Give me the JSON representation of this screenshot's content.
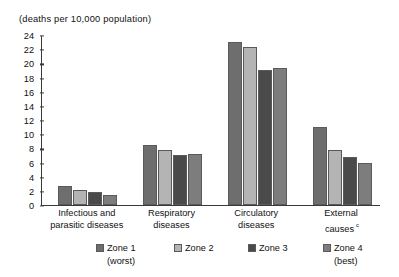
{
  "chart_data": {
    "type": "bar",
    "title": "(deaths per 10,000 population)",
    "subtitle": "",
    "xlabel": "",
    "ylabel": "",
    "ylim": [
      0,
      24
    ],
    "ytick_step": 2,
    "grid": false,
    "legend_position": "bottom",
    "categories": [
      "Infectious and parasitic diseases",
      "Respiratory diseases",
      "Circulatory diseases",
      "External causes"
    ],
    "category_lines": [
      [
        "Infectious and",
        "parasitic diseases"
      ],
      [
        "Respiratory",
        "diseases"
      ],
      [
        "Circulatory",
        "diseases"
      ],
      [
        "External",
        "causes"
      ]
    ],
    "category_footnotes": [
      "",
      "",
      "",
      "c"
    ],
    "ytick_labels": [
      "0",
      "2",
      "4",
      "6",
      "8",
      "10",
      "12",
      "14",
      "16",
      "18",
      "20",
      "22",
      "24"
    ],
    "series": [
      {
        "name": "Zone 1",
        "note": "(worst)",
        "color": "#6e6e6e",
        "values": [
          2.7,
          8.45,
          23.0,
          11.0
        ]
      },
      {
        "name": "Zone 2",
        "note": "",
        "color": "#b4b4b4",
        "values": [
          2.15,
          7.75,
          22.35,
          7.75
        ]
      },
      {
        "name": "Zone 3",
        "note": "",
        "color": "#4a4a4a",
        "values": [
          1.9,
          7.1,
          19.1,
          6.8
        ]
      },
      {
        "name": "Zone 4",
        "note": "(best)",
        "color": "#7d7d7d",
        "values": [
          1.45,
          7.2,
          19.4,
          6.0
        ]
      }
    ]
  },
  "legend": {
    "items": [
      {
        "label": "Zone 1",
        "sub": "(worst)"
      },
      {
        "label": "Zone 2",
        "sub": ""
      },
      {
        "label": "Zone 3",
        "sub": ""
      },
      {
        "label": "Zone 4",
        "sub": "(best)"
      }
    ]
  },
  "colors": {
    "axis": "#3a3a3a",
    "text": "#111111",
    "background": "#ffffff",
    "zone1": "#6e6e6e",
    "zone2": "#b4b4b4",
    "zone3": "#4a4a4a",
    "zone4": "#7d7d7d"
  }
}
